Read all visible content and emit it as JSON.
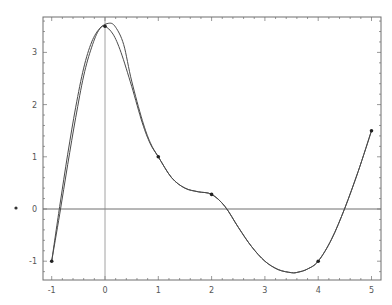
{
  "chart_data": {
    "type": "line",
    "title": "",
    "xlabel": "",
    "ylabel": "",
    "xlim": [
      -1.17,
      5.17
    ],
    "ylim": [
      -1.37,
      3.69
    ],
    "grid": false,
    "legend": null,
    "x_ticks": [
      -1,
      0,
      1,
      2,
      3,
      4,
      5
    ],
    "y_ticks": [
      -1,
      0,
      1,
      2,
      3
    ],
    "x_tick_labels": [
      "-1",
      "0",
      "1",
      "2",
      "3",
      "4",
      "5"
    ],
    "y_tick_labels": [
      "-1",
      "0",
      "1",
      "2",
      "3"
    ],
    "points": {
      "name": "Data points",
      "x": [
        -1,
        0,
        1,
        2,
        4,
        5
      ],
      "y": [
        -1,
        3.5,
        1,
        0.28,
        -1,
        1.5
      ]
    },
    "series": [
      {
        "name": "Interpolating curve (passes through points)",
        "x": [
          -1,
          -0.85,
          -0.7,
          -0.55,
          -0.4,
          -0.25,
          -0.1,
          0,
          0.15,
          0.3,
          0.5,
          0.7,
          0.85,
          1,
          1.25,
          1.5,
          1.75,
          2,
          2.25,
          2.5,
          2.75,
          3,
          3.25,
          3.5,
          3.62,
          3.8,
          4,
          4.25,
          4.5,
          4.75,
          5
        ],
        "y": [
          -1,
          0.05,
          1.05,
          1.95,
          2.7,
          3.2,
          3.46,
          3.5,
          3.35,
          3.0,
          2.35,
          1.65,
          1.25,
          1.0,
          0.6,
          0.4,
          0.33,
          0.28,
          0.05,
          -0.35,
          -0.72,
          -1.0,
          -1.16,
          -1.22,
          -1.21,
          -1.15,
          -1.0,
          -0.58,
          0.02,
          0.72,
          1.5
        ]
      },
      {
        "name": "Approximating curve",
        "x": [
          -1,
          -0.85,
          -0.7,
          -0.55,
          -0.4,
          -0.25,
          -0.1,
          0.08,
          0.2,
          0.35,
          0.5,
          0.7,
          0.85,
          1,
          1.25,
          1.5,
          1.75,
          2,
          2.25,
          2.5,
          2.75,
          3,
          3.25,
          3.5,
          3.62,
          3.8,
          4,
          4.25,
          4.5,
          4.75,
          5
        ],
        "y": [
          -1,
          -0.1,
          0.85,
          1.75,
          2.55,
          3.1,
          3.45,
          3.56,
          3.48,
          3.15,
          2.45,
          1.7,
          1.27,
          1.0,
          0.6,
          0.4,
          0.33,
          0.28,
          0.05,
          -0.35,
          -0.72,
          -1.0,
          -1.16,
          -1.22,
          -1.21,
          -1.15,
          -1.0,
          -0.58,
          0.02,
          0.72,
          1.5
        ]
      }
    ],
    "annotations": [
      {
        "text": "stray mark",
        "x_px": 16,
        "y_px": 208
      }
    ]
  },
  "colors": {
    "axes": "#6e6e6e",
    "curve": "#4a4a4a",
    "points": "#222222",
    "background": "#ffffff"
  }
}
